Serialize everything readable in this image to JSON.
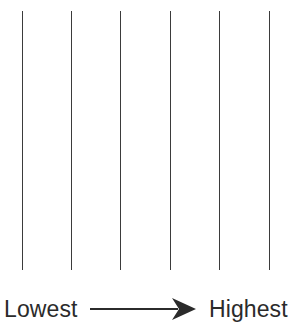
{
  "figure": {
    "background_color": "#ffffff",
    "width": 302,
    "height": 330
  },
  "diagram": {
    "type": "ordinal-scale-lines",
    "line_color": "#3b3b3b",
    "line_count": 6,
    "line_top_y": 11,
    "line_bottom_y": 270,
    "line_x_positions": [
      22,
      71,
      120,
      170,
      219,
      269
    ],
    "line_thickness": 1.4
  },
  "legend": {
    "low_label": "Lowest",
    "high_label": "Highest",
    "arrow": {
      "name": "right-arrow",
      "color": "#2b2b2b",
      "direction": "right",
      "start_x": 90,
      "end_x": 196
    },
    "text_color": "#2b2b2b"
  },
  "chart_data": {
    "type": "line",
    "title": "",
    "xlabel": "",
    "ylabel": "",
    "categories": [
      "1",
      "2",
      "3",
      "4",
      "5",
      "6"
    ],
    "values": [
      1,
      2,
      3,
      4,
      5,
      6
    ],
    "axis_annotation_low": "Lowest",
    "axis_annotation_high": "Highest",
    "grid": false,
    "legend_position": "bottom"
  }
}
